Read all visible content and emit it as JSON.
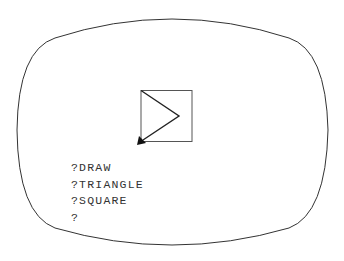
{
  "screen": {
    "type": "logo-turtle-graphics-display",
    "frame_color": "#333333",
    "drawing": {
      "square": {
        "x": 141,
        "y": 90,
        "size": 51
      },
      "triangle_points": [
        [
          141,
          90
        ],
        [
          179,
          116
        ],
        [
          141,
          142
        ]
      ],
      "turtle": {
        "x": 141,
        "y": 142,
        "heading": "down-left"
      }
    }
  },
  "console": {
    "lines": [
      "?DRAW",
      "?TRIANGLE",
      "?SQUARE",
      "?"
    ]
  }
}
